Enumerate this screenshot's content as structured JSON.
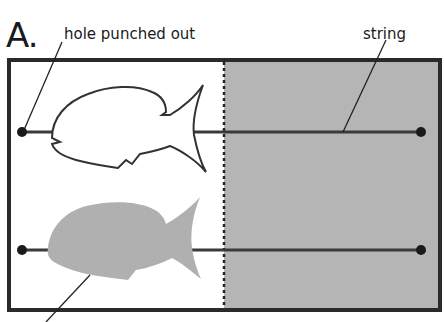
{
  "figure": {
    "panel_label": "A.",
    "callouts": {
      "hole": "hole punched out",
      "string": "string"
    },
    "colors": {
      "frame": "#2a2a2a",
      "gray_panel": "#b5b5b5",
      "fish_fill": "#b0b0b0",
      "fish_outline": "#333333",
      "string": "#3a3a3a",
      "dot": "#1a1a1a"
    },
    "elements": [
      {
        "name": "outline-fish",
        "row": 1,
        "style": "outline"
      },
      {
        "name": "filled-fish",
        "row": 2,
        "style": "filled-gray"
      },
      {
        "name": "string-top",
        "row": 1
      },
      {
        "name": "string-bottom",
        "row": 2
      },
      {
        "name": "fold-line",
        "style": "dotted"
      }
    ]
  }
}
